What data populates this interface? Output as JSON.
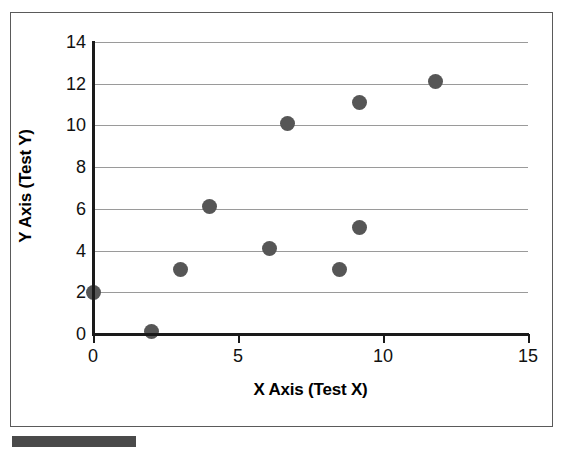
{
  "figure": {
    "background_color": "#ffffff",
    "frame_color": "#5a5a5a",
    "caption_bar_color": "#4a4a4a"
  },
  "chart_data": {
    "type": "scatter",
    "title": "",
    "xlabel": "X Axis (Test X)",
    "ylabel": "Y Axis (Test Y)",
    "xlim": [
      0,
      15
    ],
    "ylim": [
      0,
      14
    ],
    "xticks": [
      0,
      5,
      10,
      15
    ],
    "yticks": [
      0,
      2,
      4,
      6,
      8,
      10,
      12,
      14
    ],
    "xtick_labels": [
      "0",
      "5",
      "10",
      "15"
    ],
    "ytick_labels": [
      "0",
      "2",
      "4",
      "6",
      "8",
      "10",
      "12",
      "14"
    ],
    "grid": {
      "horizontal": true,
      "vertical": false,
      "color": "#9a9a9a"
    },
    "legend": null,
    "marker": {
      "shape": "circle",
      "color": "#565656",
      "size_px": 15
    },
    "series": [
      {
        "name": "Test data",
        "points": [
          {
            "x": 0.0,
            "y": 2.0
          },
          {
            "x": 2.0,
            "y": 0.1
          },
          {
            "x": 3.0,
            "y": 3.1
          },
          {
            "x": 4.0,
            "y": 6.1
          },
          {
            "x": 6.1,
            "y": 4.1
          },
          {
            "x": 6.7,
            "y": 10.1
          },
          {
            "x": 8.5,
            "y": 3.1
          },
          {
            "x": 9.2,
            "y": 5.1
          },
          {
            "x": 9.2,
            "y": 11.1
          },
          {
            "x": 11.8,
            "y": 12.1
          }
        ]
      }
    ]
  }
}
